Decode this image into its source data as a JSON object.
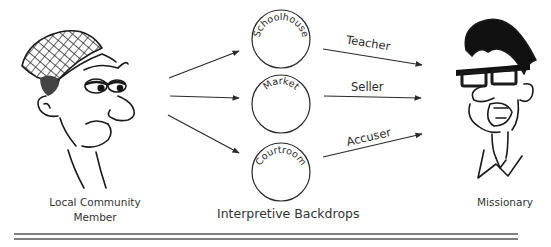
{
  "left_figure": {
    "label_line1": "Local Community",
    "label_line2": "Member"
  },
  "right_figure": {
    "label": "Missionary"
  },
  "backdrops": {
    "caption": "Interpretive Backdrops",
    "items": [
      {
        "label": "Schoolhouse"
      },
      {
        "label": "Market"
      },
      {
        "label": "Courtroom"
      }
    ]
  },
  "roles": [
    {
      "label": "Teacher"
    },
    {
      "label": "Seller"
    },
    {
      "label": "Accuser"
    }
  ],
  "colors": {
    "line": "#2a2a2a",
    "background": "#ffffff"
  }
}
